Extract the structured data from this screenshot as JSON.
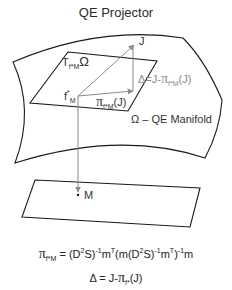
{
  "title": "QE Projector",
  "labels": {
    "tangent_space": {
      "base": "T",
      "sub": "f*M",
      "omega": "Ω"
    },
    "point_f": {
      "base": "f",
      "sup": "*",
      "sub": "M"
    },
    "point_J": "J",
    "point_M": "M",
    "projection": {
      "pi": "π",
      "sub": "f*M",
      "arg": "(J)"
    },
    "delta": {
      "lhs": "Δ=",
      "rhs": "J-",
      "pi": "π",
      "sub": "f*M",
      "arg": "(J)"
    },
    "manifold": "Ω – QE Manifold"
  },
  "formulas": {
    "projector": {
      "pi": "π",
      "sub": "f*M",
      "eq": " = (D",
      "p1": "2",
      "t1": "S)",
      "p2": "-1",
      "t2": "m",
      "p3": "T",
      "t3": "(m(D",
      "p4": "2",
      "t4": "S)",
      "p5": "-1",
      "t5": "m",
      "p6": "T",
      "t6": ")",
      "p7": "-1",
      "t7": "m"
    },
    "delta": {
      "lhs": "Δ = J-",
      "pi": "π",
      "sub": "f*",
      "arg": "(J)"
    }
  },
  "colors": {
    "outline": "#1a1a1a",
    "vector": "#8a8a8a",
    "text": "#333333"
  }
}
